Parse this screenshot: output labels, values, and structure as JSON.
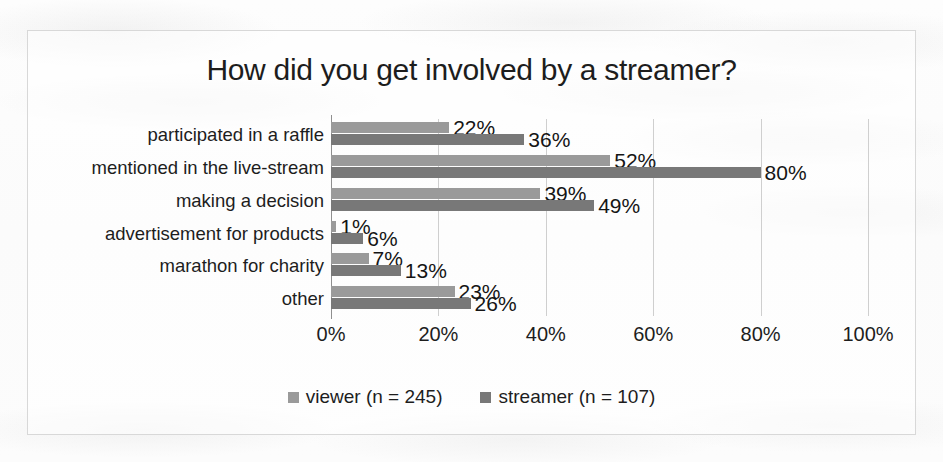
{
  "chart_data": {
    "type": "bar",
    "orientation": "horizontal",
    "title": "How did you get involved by a streamer?",
    "xlabel": "",
    "ylabel": "",
    "xlim": [
      0,
      100
    ],
    "xticks": [
      "0%",
      "20%",
      "40%",
      "60%",
      "80%",
      "100%"
    ],
    "xtick_values": [
      0,
      20,
      40,
      60,
      80,
      100
    ],
    "grid": true,
    "legend_position": "bottom",
    "categories": [
      "participated in a raffle",
      "mentioned in the live-stream",
      "making a decision",
      "advertisement for products",
      "marathon for charity",
      "other"
    ],
    "series": [
      {
        "name": "viewer (n = 245)",
        "color": "#9a9a9a",
        "values": [
          22,
          52,
          39,
          1,
          7,
          23
        ],
        "labels": [
          "22%",
          "52%",
          "39%",
          "1%",
          "7%",
          "23%"
        ]
      },
      {
        "name": "streamer (n = 107)",
        "color": "#787878",
        "values": [
          36,
          80,
          49,
          6,
          13,
          26
        ],
        "labels": [
          "36%",
          "80%",
          "49%",
          "6%",
          "13%",
          "26%"
        ]
      }
    ]
  },
  "legend": {
    "items": [
      {
        "label": "viewer (n = 245)",
        "swatch": "viewer"
      },
      {
        "label": "streamer (n = 107)",
        "swatch": "streamer"
      }
    ]
  }
}
